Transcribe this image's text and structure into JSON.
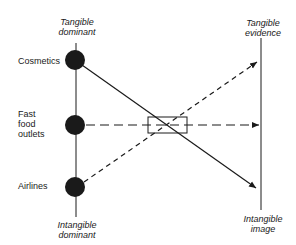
{
  "diagram": {
    "left_axis": {
      "top_label": "Tangible\ndominant",
      "bottom_label": "Intangible\ndominant"
    },
    "right_axis": {
      "top_label": "Tangible\nevidence",
      "bottom_label": "Intangible\nimage"
    },
    "categories": [
      {
        "label": "Cosmetics"
      },
      {
        "label": "Fast\nfood\noutlets"
      },
      {
        "label": "Airlines"
      }
    ],
    "connections": [
      {
        "from": "Cosmetics",
        "to": "Intangible image",
        "style": "solid"
      },
      {
        "from": "Fast food outlets",
        "to": "Middle of right axis",
        "style": "long-dash"
      },
      {
        "from": "Airlines",
        "to": "Tangible evidence",
        "style": "short-dash"
      }
    ],
    "colors": {
      "ink": "#1a1a1a",
      "background": "#ffffff"
    }
  }
}
